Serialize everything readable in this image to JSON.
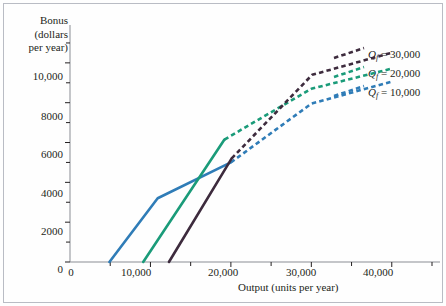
{
  "figure": {
    "background_color": "#fefefe",
    "border_color": "#b9bcc4"
  },
  "chart_data": {
    "type": "line",
    "title": "",
    "xlabel": "Output (units per year)",
    "ylabel_lines": [
      "Bonus",
      "(dollars",
      "per year)"
    ],
    "xlim": [
      0,
      45000
    ],
    "ylim": [
      0,
      11500
    ],
    "grid": false,
    "legend_position": "right",
    "xticks": [
      0,
      10000,
      20000,
      30000,
      40000
    ],
    "xtick_labels": [
      "0",
      "10,000",
      "20,000",
      "30,000",
      "40,000"
    ],
    "x_minor_ticks": [
      5000,
      15000,
      25000,
      35000,
      45000
    ],
    "yticks": [
      0,
      2000,
      4000,
      6000,
      8000,
      10000
    ],
    "ytick_labels": [
      "0",
      "2000",
      "4000",
      "6000",
      "8000",
      "10,000"
    ],
    "y_minor_ticks": [
      1000,
      3000,
      5000,
      7000,
      9000,
      11000
    ],
    "series": [
      {
        "name": "Qf = 10,000",
        "legend_label_base": "Q",
        "legend_label_sub": "f",
        "legend_label_value": " = 10,000",
        "color": "#2f7cb7",
        "solid_points": [
          [
            4900,
            0
          ],
          [
            10900,
            3200
          ],
          [
            20000,
            5000
          ]
        ],
        "dashed_points": [
          [
            20000,
            5000
          ],
          [
            30000,
            7950
          ],
          [
            39900,
            9050
          ]
        ]
      },
      {
        "name": "Qf = 20,000",
        "legend_label_base": "Q",
        "legend_label_sub": "f",
        "legend_label_value": " = 20,000",
        "color": "#1a9b79",
        "solid_points": [
          [
            9100,
            0
          ],
          [
            19200,
            6150
          ]
        ],
        "dashed_points": [
          [
            19200,
            6150
          ],
          [
            30000,
            8700
          ],
          [
            39900,
            9700
          ]
        ]
      },
      {
        "name": "Qf = 30,000",
        "legend_label_base": "Q",
        "legend_label_sub": "f",
        "legend_label_value": " = 30,000",
        "color": "#3d2b3d",
        "solid_points": [
          [
            12300,
            0
          ],
          [
            20100,
            5200
          ]
        ],
        "dashed_points": [
          [
            20100,
            5200
          ],
          [
            30100,
            9400
          ],
          [
            39900,
            10500
          ]
        ]
      }
    ]
  },
  "legend": [
    {
      "base": "Q",
      "sub": "f",
      "value": " = 30,000"
    },
    {
      "base": "Q",
      "sub": "f",
      "value": " = 20,000"
    },
    {
      "base": "Q",
      "sub": "f",
      "value": " = 10,000"
    }
  ]
}
